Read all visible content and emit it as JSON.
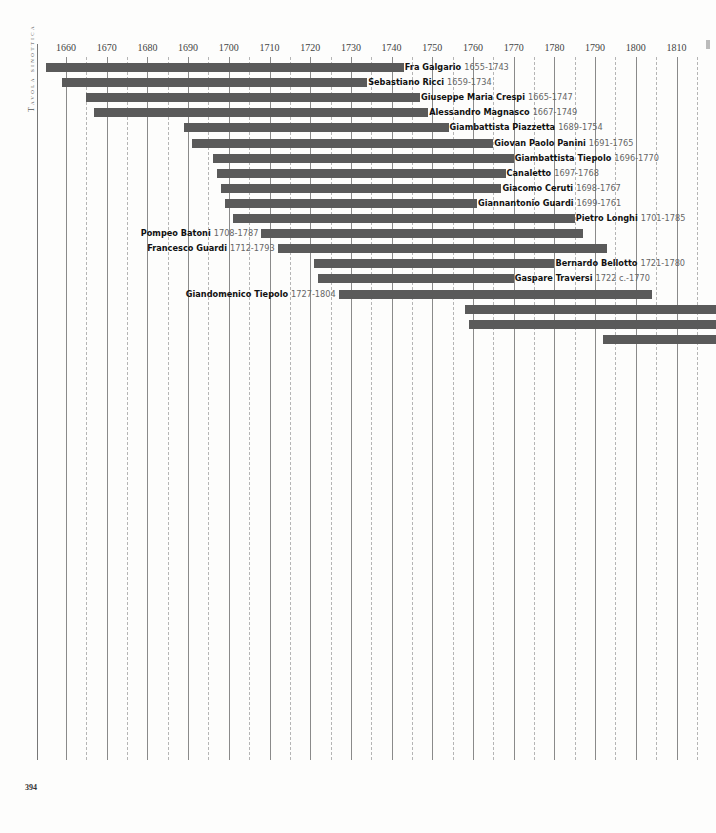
{
  "page": {
    "side_title": "Tavola sinottica",
    "page_number": "394"
  },
  "chart_data": {
    "type": "bar",
    "orientation": "horizontal-timeline",
    "title": "Tavola sinottica",
    "xlabel": "",
    "ylabel": "",
    "xlim": [
      1650,
      1820
    ],
    "x_ticks": [
      1660,
      1670,
      1680,
      1690,
      1700,
      1710,
      1720,
      1730,
      1740,
      1750,
      1760,
      1770,
      1780,
      1790,
      1800,
      1810
    ],
    "grid": {
      "major_every_years": 10,
      "minor_dashed_offset_years": 5
    },
    "colors": {
      "bar": "#5a5a5a",
      "major_grid": "#8a8a8a",
      "minor_grid": "#b5b5b5",
      "name_text": "#111111",
      "dates_text": "#666666"
    },
    "series": [
      {
        "name": "Fra Galgario",
        "dates": "1655-1743",
        "start": 1655,
        "end": 1743,
        "label_side": "right"
      },
      {
        "name": "Sebastiano Ricci",
        "dates": "1659-1734",
        "start": 1659,
        "end": 1734,
        "label_side": "right"
      },
      {
        "name": "Giuseppe Maria Crespi",
        "dates": "1665-1747",
        "start": 1665,
        "end": 1747,
        "label_side": "right"
      },
      {
        "name": "Alessandro Magnasco",
        "dates": "1667-1749",
        "start": 1667,
        "end": 1749,
        "label_side": "right"
      },
      {
        "name": "Giambattista Piazzetta",
        "dates": "1689-1754",
        "start": 1689,
        "end": 1754,
        "label_side": "right"
      },
      {
        "name": "Giovan Paolo Panini",
        "dates": "1691-1765",
        "start": 1691,
        "end": 1765,
        "label_side": "right"
      },
      {
        "name": "Giambattista Tiepolo",
        "dates": "1696-1770",
        "start": 1696,
        "end": 1770,
        "label_side": "right"
      },
      {
        "name": "Canaletto",
        "dates": "1697-1768",
        "start": 1697,
        "end": 1768,
        "label_side": "right"
      },
      {
        "name": "Giacomo Ceruti",
        "dates": "1698-1767",
        "start": 1698,
        "end": 1767,
        "label_side": "right"
      },
      {
        "name": "Giannantonio Guardi",
        "dates": "1699-1761",
        "start": 1699,
        "end": 1761,
        "label_side": "right"
      },
      {
        "name": "Pietro Longhi",
        "dates": "1701-1785",
        "start": 1701,
        "end": 1785,
        "label_side": "right"
      },
      {
        "name": "Pompeo Batoni",
        "dates": "1708-1787",
        "start": 1708,
        "end": 1787,
        "label_side": "left"
      },
      {
        "name": "Francesco Guardi",
        "dates": "1712-1793",
        "start": 1712,
        "end": 1793,
        "label_side": "left"
      },
      {
        "name": "Bernardo Bellotto",
        "dates": "1721-1780",
        "start": 1721,
        "end": 1780,
        "label_side": "right"
      },
      {
        "name": "Gaspare Traversi",
        "dates": "1722 c.-1770",
        "start": 1722,
        "end": 1770,
        "label_side": "right"
      },
      {
        "name": "Giandomenico Tiepolo",
        "dates": "1727-1804",
        "start": 1727,
        "end": 1804,
        "label_side": "left"
      },
      {
        "name": "",
        "dates": "",
        "start": 1758,
        "end": 1820,
        "label_side": "none"
      },
      {
        "name": "",
        "dates": "",
        "start": 1759,
        "end": 1820,
        "label_side": "none"
      },
      {
        "name": "",
        "dates": "",
        "start": 1792,
        "end": 1820,
        "label_side": "none"
      }
    ]
  }
}
